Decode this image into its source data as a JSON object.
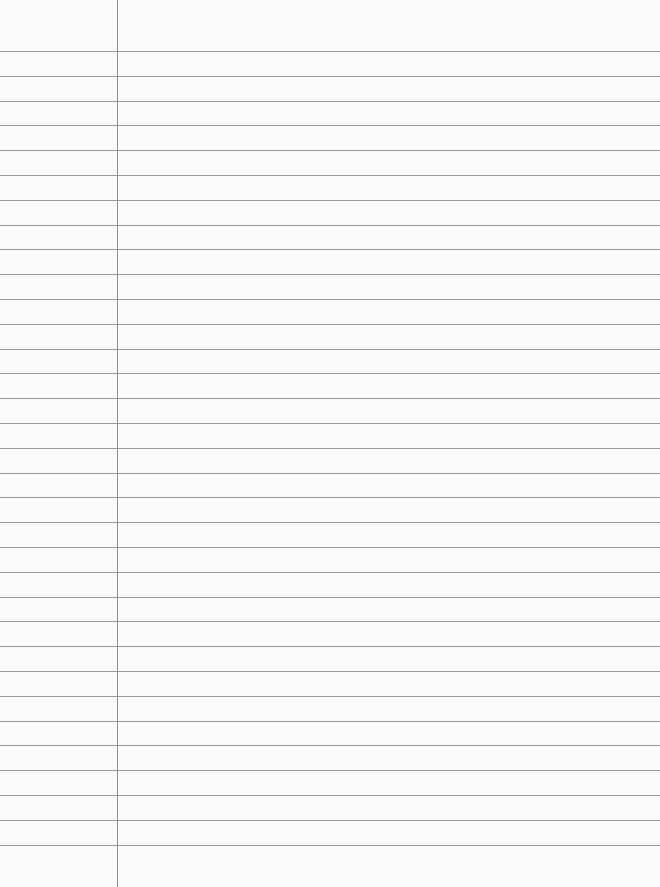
{
  "paper": {
    "type": "lined-notebook-page",
    "background_color": "#fbfbf9",
    "rule_color": "#9a9a98",
    "margin_color": "#8c8c8a",
    "margin_x": 117,
    "first_rule_y": 51,
    "rule_spacing": 24.8,
    "rule_count": 33
  }
}
